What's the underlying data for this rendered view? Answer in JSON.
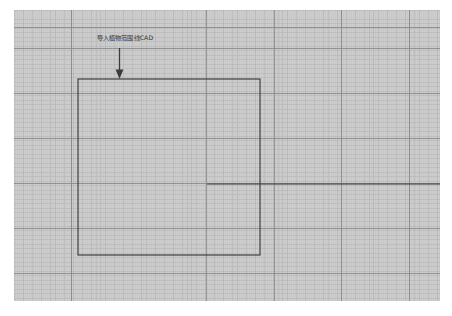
{
  "document": {
    "kind": "cad-site-plan-diagram",
    "page_background": "#ffffff",
    "canvas_background": "#cacaca"
  },
  "canvas": {
    "x": 14,
    "y": 10,
    "width": 426,
    "height": 291,
    "grid": {
      "minor_spacing_px": 4.55,
      "major_spacing_x_px": 67.6,
      "major_spacing_y_px": 45,
      "minor_color": "#afafaf",
      "major_color": "#848484"
    }
  },
  "annotation": {
    "label": "导入植物范围线CAD",
    "label_color": "#4e4e4e",
    "arrow_direction": "down",
    "arrow_color": "#3b3b3b",
    "arrow_icon": "arrow-down-icon"
  },
  "geometry": {
    "line_color": "#3a3a3a",
    "shapes": [
      {
        "name": "plant-range-rectangle",
        "type": "rectangle",
        "x": 64,
        "y": 69,
        "width": 182,
        "height": 176
      },
      {
        "name": "baseline-horizontal",
        "type": "line",
        "x1": 193,
        "y1": 174,
        "x2": 426,
        "y2": 174
      }
    ]
  }
}
